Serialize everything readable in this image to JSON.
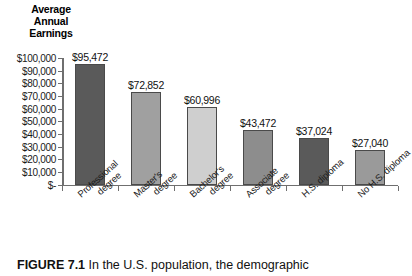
{
  "chart_data": {
    "type": "bar",
    "title": "Average Annual Earnings",
    "title_lines": [
      "Average",
      "Annual",
      "Earnings"
    ],
    "xlabel": "",
    "ylabel": "Average Annual Earnings",
    "ylim": [
      0,
      100000
    ],
    "grid": false,
    "legend": "none",
    "categories": [
      "Professional degree",
      "Master's degree",
      "Bachelor's degree",
      "Associate degree",
      "H.S. diploma",
      "No H.S. diploma"
    ],
    "category_lines": [
      [
        "Professional",
        "degree"
      ],
      [
        "Master's",
        "degree"
      ],
      [
        "Bachelor's",
        "degree"
      ],
      [
        "Associate",
        "degree"
      ],
      [
        "H.S. diploma",
        ""
      ],
      [
        "No H.S. diploma",
        ""
      ]
    ],
    "values": [
      95472,
      72852,
      60996,
      43472,
      37024,
      27040
    ],
    "value_labels": [
      "$95,472",
      "$72,852",
      "$60,996",
      "$43,472",
      "$37,024",
      "$27,040"
    ],
    "bar_colors": [
      "#5a5a5a",
      "#a0a0a0",
      "#cfcfcf",
      "#8d8d8d",
      "#5a5a5a",
      "#9a9a9a"
    ],
    "ytick_values": [
      0,
      10000,
      20000,
      30000,
      40000,
      50000,
      60000,
      70000,
      80000,
      90000,
      100000
    ],
    "ytick_labels": [
      "$-",
      "$10,000",
      "$20,000",
      "$30,000",
      "$40,000",
      "$50,000",
      "$60,000",
      "$70,000",
      "$80,000",
      "$90,000",
      "$100,000"
    ]
  },
  "caption": {
    "figure_number": "FIGURE 7.1",
    "text": " In the U.S. population, the demographic"
  }
}
